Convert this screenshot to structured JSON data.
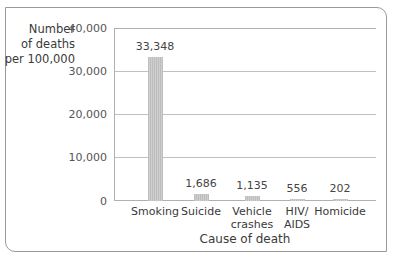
{
  "chart_data": {
    "type": "bar",
    "title": "",
    "xlabel": "Cause of death",
    "ylabel": "Number of deaths per 100,000",
    "ylabel_lines": [
      "Number",
      "of deaths",
      "per 100,000"
    ],
    "categories": [
      "Smoking",
      "Suicide",
      "Vehicle crashes",
      "HIV/ AIDS",
      "Homicide"
    ],
    "category_lines": [
      [
        "Smoking"
      ],
      [
        "Suicide"
      ],
      [
        "Vehicle",
        "crashes"
      ],
      [
        "HIV/",
        "AIDS"
      ],
      [
        "Homicide"
      ]
    ],
    "values": [
      33348,
      1686,
      1135,
      556,
      202
    ],
    "value_labels": [
      "33,348",
      "1,686",
      "1,135",
      "556",
      "202"
    ],
    "ylim": [
      0,
      40000
    ],
    "yticks": [
      0,
      10000,
      20000,
      30000,
      40000
    ],
    "ytick_labels": [
      "0",
      "10,000",
      "20,000",
      "30,000",
      "40,000"
    ],
    "grid": true,
    "legend": null,
    "bar_color": "#c6c6c6"
  }
}
